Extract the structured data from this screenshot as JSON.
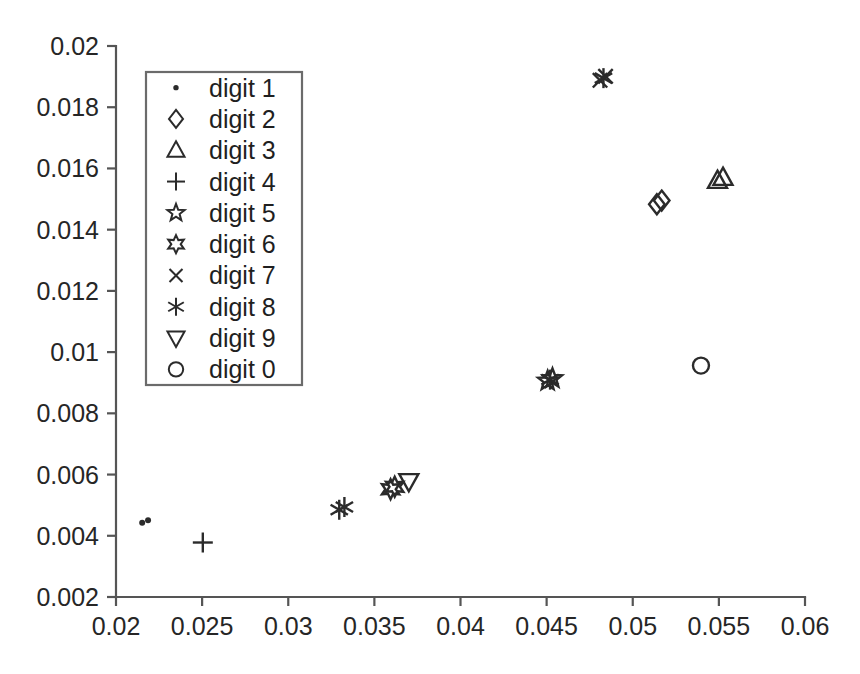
{
  "chart_data": {
    "type": "scatter",
    "title": "",
    "xlabel": "",
    "ylabel": "",
    "xlim": [
      0.02,
      0.06
    ],
    "ylim": [
      0.002,
      0.02
    ],
    "grid": false,
    "legend_position": "upper-left",
    "x_ticks": [
      "0.02",
      "0.025",
      "0.03",
      "0.035",
      "0.04",
      "0.045",
      "0.05",
      "0.055",
      "0.06"
    ],
    "x_tick_values": [
      0.02,
      0.025,
      0.03,
      0.035,
      0.04,
      0.045,
      0.05,
      0.055,
      0.06
    ],
    "y_ticks": [
      "0.002",
      "0.004",
      "0.006",
      "0.008",
      "0.01",
      "0.012",
      "0.014",
      "0.016",
      "0.018",
      "0.02"
    ],
    "y_tick_values": [
      0.002,
      0.004,
      0.006,
      0.008,
      0.01,
      0.012,
      0.014,
      0.016,
      0.018,
      0.02
    ],
    "series": [
      {
        "name": "digit 1",
        "marker": "dot",
        "points": [
          {
            "x": 0.02152,
            "y": 0.004425
          },
          {
            "x": 0.02186,
            "y": 0.004505
          }
        ]
      },
      {
        "name": "digit 2",
        "marker": "diamond",
        "points": [
          {
            "x": 0.0514,
            "y": 0.01483
          },
          {
            "x": 0.05168,
            "y": 0.01495
          }
        ]
      },
      {
        "name": "digit 3",
        "marker": "triangle-up",
        "points": [
          {
            "x": 0.05492,
            "y": 0.0156
          },
          {
            "x": 0.05524,
            "y": 0.0157
          }
        ]
      },
      {
        "name": "digit 4",
        "marker": "plus",
        "points": [
          {
            "x": 0.02504,
            "y": 0.00378
          }
        ]
      },
      {
        "name": "digit 5",
        "marker": "star5",
        "points": [
          {
            "x": 0.04506,
            "y": 0.00906
          },
          {
            "x": 0.04534,
            "y": 0.00914
          }
        ]
      },
      {
        "name": "digit 6",
        "marker": "star6",
        "points": [
          {
            "x": 0.03594,
            "y": 0.00552
          },
          {
            "x": 0.03618,
            "y": 0.0056
          }
        ]
      },
      {
        "name": "digit 7",
        "marker": "cross-x",
        "points": [
          {
            "x": 0.0481,
            "y": 0.01888
          },
          {
            "x": 0.04842,
            "y": 0.01901
          }
        ]
      },
      {
        "name": "digit 8",
        "marker": "asterisk",
        "points": [
          {
            "x": 0.03296,
            "y": 0.00485
          },
          {
            "x": 0.03326,
            "y": 0.00494
          },
          {
            "x": 0.0452,
            "y": 0.0091
          },
          {
            "x": 0.0483,
            "y": 0.01895
          }
        ]
      },
      {
        "name": "digit 9",
        "marker": "triangle-down",
        "points": [
          {
            "x": 0.037,
            "y": 0.00578
          }
        ]
      },
      {
        "name": "digit 0",
        "marker": "circle",
        "points": [
          {
            "x": 0.05396,
            "y": 0.00956
          }
        ]
      }
    ]
  },
  "legend": {
    "entries": [
      {
        "label": "digit 1",
        "marker": "dot"
      },
      {
        "label": "digit 2",
        "marker": "diamond"
      },
      {
        "label": "digit 3",
        "marker": "triangle-up"
      },
      {
        "label": "digit 4",
        "marker": "plus"
      },
      {
        "label": "digit 5",
        "marker": "star5"
      },
      {
        "label": "digit 6",
        "marker": "star6"
      },
      {
        "label": "digit 7",
        "marker": "cross-x"
      },
      {
        "label": "digit 8",
        "marker": "asterisk"
      },
      {
        "label": "digit 9",
        "marker": "triangle-down"
      },
      {
        "label": "digit 0",
        "marker": "circle"
      }
    ]
  },
  "colors": {
    "marker": "#2b2b2b",
    "axis": "#555555",
    "text": "#262626",
    "background": "#ffffff",
    "legend_border": "#6b6b6b"
  }
}
